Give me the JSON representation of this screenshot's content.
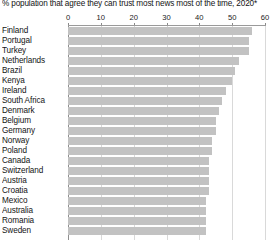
{
  "chart_data": {
    "type": "bar",
    "orientation": "horizontal",
    "title": "% population that agree they can trust most news most of the time, 2020*",
    "xlabel": "",
    "ylabel": "",
    "xlim": [
      0,
      60
    ],
    "xticks": [
      0,
      10,
      20,
      30,
      40,
      50,
      60
    ],
    "xtick_labels": [
      "0",
      "10",
      "20",
      "30",
      "40",
      "50",
      "60"
    ],
    "grid": true,
    "grid_axis": "x",
    "legend": false,
    "bar_color": "#c2c2c2",
    "background_color": "#ffffff",
    "note": "Chart is cropped at the bottom edge of the screenshot; additional countries continue below Sweden.",
    "categories": [
      "Finland",
      "Portugal",
      "Turkey",
      "Netherlands",
      "Brazil",
      "Kenya",
      "Ireland",
      "South Africa",
      "Denmark",
      "Belgium",
      "Germany",
      "Norway",
      "Poland",
      "Canada",
      "Switzerland",
      "Austria",
      "Croatia",
      "Mexico",
      "Australia",
      "Romania",
      "Sweden"
    ],
    "values": [
      56,
      55,
      55,
      52,
      51,
      50,
      48,
      47,
      46,
      45,
      45,
      44,
      44,
      43,
      43,
      43,
      43,
      42,
      42,
      42,
      42
    ]
  }
}
